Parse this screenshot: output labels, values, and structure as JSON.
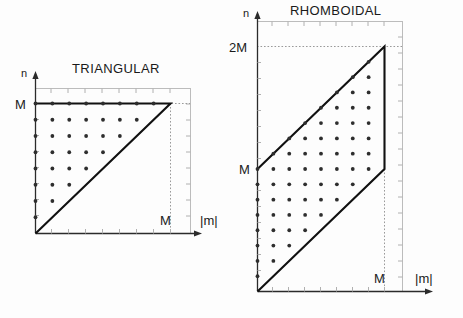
{
  "figure": {
    "background_color": "#fdfdfd",
    "frame_color": "#bcbcbc",
    "line_color": "#111111",
    "dot_color": "#2e2e2e"
  },
  "panels": {
    "triangular": {
      "title": "TRIANGULAR",
      "y_axis_label": "n",
      "x_axis_label": "|m|",
      "y_tick_label": "M",
      "x_tick_label": "M"
    },
    "rhomboidal": {
      "title": "RHOMBOIDAL",
      "y_axis_label": "n",
      "x_axis_label": "|m|",
      "y_tick_label_top": "2M",
      "y_tick_label_mid": "M",
      "x_tick_label": "M"
    }
  },
  "chart_data": [
    {
      "type": "scatter",
      "title": "TRIANGULAR",
      "xlabel": "|m|",
      "ylabel": "n",
      "xlim": [
        0,
        10
      ],
      "ylim": [
        0,
        10
      ],
      "xticks": [
        0,
        8
      ],
      "xticklabels": [
        "",
        "M"
      ],
      "yticks": [
        0,
        8
      ],
      "yticklabels": [
        "",
        "M"
      ],
      "grid": false,
      "description": "Lattice points of the triangular truncation n <= M, |m| <= n, drawn on a half-integer offset grid; boundary polyline drawn from origin along the diagonal n=|m| to (M,M) then left along n=M back to the n axis.",
      "region_vertices": [
        [
          0,
          0
        ],
        [
          8,
          8
        ],
        [
          0,
          8
        ]
      ],
      "lattice_spacing": 1,
      "lattice_points": [
        [
          0,
          1
        ],
        [
          0,
          2
        ],
        [
          0,
          3
        ],
        [
          0,
          4
        ],
        [
          0,
          5
        ],
        [
          0,
          6
        ],
        [
          0,
          7
        ],
        [
          0,
          8
        ],
        [
          1,
          2
        ],
        [
          1,
          3
        ],
        [
          1,
          4
        ],
        [
          1,
          5
        ],
        [
          1,
          6
        ],
        [
          1,
          7
        ],
        [
          1,
          8
        ],
        [
          2,
          3
        ],
        [
          2,
          4
        ],
        [
          2,
          5
        ],
        [
          2,
          6
        ],
        [
          2,
          7
        ],
        [
          2,
          8
        ],
        [
          3,
          4
        ],
        [
          3,
          5
        ],
        [
          3,
          6
        ],
        [
          3,
          7
        ],
        [
          3,
          8
        ],
        [
          4,
          5
        ],
        [
          4,
          6
        ],
        [
          4,
          7
        ],
        [
          4,
          8
        ],
        [
          5,
          6
        ],
        [
          5,
          7
        ],
        [
          5,
          8
        ],
        [
          6,
          7
        ],
        [
          6,
          8
        ],
        [
          7,
          8
        ]
      ]
    },
    {
      "type": "scatter",
      "title": "RHOMBOIDAL",
      "xlabel": "|m|",
      "ylabel": "n",
      "xlim": [
        0,
        11
      ],
      "ylim": [
        0,
        20
      ],
      "xticks": [
        0,
        8
      ],
      "xticklabels": [
        "",
        "M"
      ],
      "yticks": [
        0,
        8,
        16
      ],
      "yticklabels": [
        "",
        "M",
        "2M"
      ],
      "grid": false,
      "description": "Lattice points of the rhomboidal truncation |m| <= M and |m| <= n <= M + |m|; the region is a parallelogram with vertices (0,0), (M,M), (M,2M), (0,M).",
      "region_vertices": [
        [
          0,
          0
        ],
        [
          8,
          8
        ],
        [
          8,
          16
        ],
        [
          0,
          8
        ]
      ],
      "lattice_spacing": 1,
      "lattice_points": [
        [
          0,
          1
        ],
        [
          0,
          2
        ],
        [
          0,
          3
        ],
        [
          0,
          4
        ],
        [
          0,
          5
        ],
        [
          0,
          6
        ],
        [
          0,
          7
        ],
        [
          0,
          8
        ],
        [
          1,
          2
        ],
        [
          1,
          3
        ],
        [
          1,
          4
        ],
        [
          1,
          5
        ],
        [
          1,
          6
        ],
        [
          1,
          7
        ],
        [
          1,
          8
        ],
        [
          1,
          9
        ],
        [
          2,
          3
        ],
        [
          2,
          4
        ],
        [
          2,
          5
        ],
        [
          2,
          6
        ],
        [
          2,
          7
        ],
        [
          2,
          8
        ],
        [
          2,
          9
        ],
        [
          2,
          10
        ],
        [
          3,
          4
        ],
        [
          3,
          5
        ],
        [
          3,
          6
        ],
        [
          3,
          7
        ],
        [
          3,
          8
        ],
        [
          3,
          9
        ],
        [
          3,
          10
        ],
        [
          3,
          11
        ],
        [
          4,
          5
        ],
        [
          4,
          6
        ],
        [
          4,
          7
        ],
        [
          4,
          8
        ],
        [
          4,
          9
        ],
        [
          4,
          10
        ],
        [
          4,
          11
        ],
        [
          4,
          12
        ],
        [
          5,
          6
        ],
        [
          5,
          7
        ],
        [
          5,
          8
        ],
        [
          5,
          9
        ],
        [
          5,
          10
        ],
        [
          5,
          11
        ],
        [
          5,
          12
        ],
        [
          5,
          13
        ],
        [
          6,
          7
        ],
        [
          6,
          8
        ],
        [
          6,
          9
        ],
        [
          6,
          10
        ],
        [
          6,
          11
        ],
        [
          6,
          12
        ],
        [
          6,
          13
        ],
        [
          6,
          14
        ],
        [
          7,
          8
        ],
        [
          7,
          9
        ],
        [
          7,
          10
        ],
        [
          7,
          11
        ],
        [
          7,
          12
        ],
        [
          7,
          13
        ],
        [
          7,
          14
        ],
        [
          7,
          15
        ]
      ]
    }
  ]
}
